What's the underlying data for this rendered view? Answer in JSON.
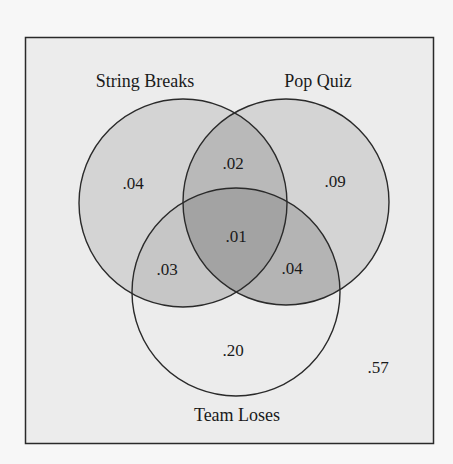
{
  "diagram": {
    "type": "venn-3",
    "sets": [
      {
        "name": "String Breaks"
      },
      {
        "name": "Pop Quiz"
      },
      {
        "name": "Team Loses"
      }
    ],
    "regions": {
      "string_only": ".04",
      "string_pop": ".02",
      "pop_only": ".09",
      "all_three": ".01",
      "string_team": ".03",
      "pop_team": ".04",
      "team_only": ".20",
      "none": ".57"
    },
    "colors": {
      "page": "#f7f7f7",
      "frame_fill": "#ececec",
      "single": "#d4d4d4",
      "pair": "#b9b9b9",
      "triple": "#a3a3a3",
      "stroke": "#2a2a2a"
    }
  }
}
